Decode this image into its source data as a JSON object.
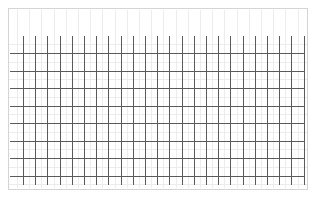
{
  "figure": {
    "kind": "grid-graphic",
    "background_color": "#ffffff",
    "width": 316,
    "height": 198,
    "has_text": false
  },
  "frame": {
    "name": "outer-border-rectangle",
    "left": 8,
    "top": 8,
    "width": 300,
    "height": 182,
    "border_color": "#d4d4d4",
    "border_width": 1,
    "fill": "none"
  },
  "grid": {
    "line_color": "#5a5a5a",
    "line_width": 1,
    "vertical": {
      "count": 24,
      "first_x": 23,
      "spacing": 12.2,
      "top": 36,
      "bottom": 185
    },
    "horizontal": {
      "count": 8,
      "first_y": 53,
      "spacing": 17.55,
      "left": 10,
      "right": 305
    }
  },
  "faint_grid": {
    "line_color": "#ececec",
    "line_width": 1,
    "vertical": {
      "count": 24,
      "first_x": 17,
      "spacing": 12.2,
      "top": 10,
      "bottom": 188
    },
    "horizontal": {
      "count": 9,
      "first_y": 44,
      "spacing": 17.55,
      "left": 9,
      "right": 307
    }
  }
}
